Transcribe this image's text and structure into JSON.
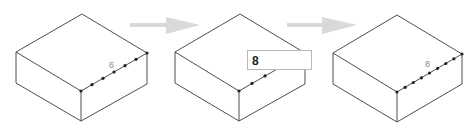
{
  "figure": {
    "colors": {
      "edge": "#3a3a3a",
      "dot": "#222222",
      "arrow": "#d9d9d9",
      "label": "#888888",
      "input_border": "#b8b8b8"
    }
  },
  "steps": [
    {
      "name": "step-1",
      "segment_label": "6",
      "segments": 6
    },
    {
      "name": "step-2",
      "input_value": "8"
    },
    {
      "name": "step-3",
      "segment_label": "8",
      "segments": 8
    }
  ],
  "arrows": [
    {
      "name": "arrow-1",
      "icon": "right-arrow-icon"
    },
    {
      "name": "arrow-2",
      "icon": "right-arrow-icon"
    }
  ]
}
